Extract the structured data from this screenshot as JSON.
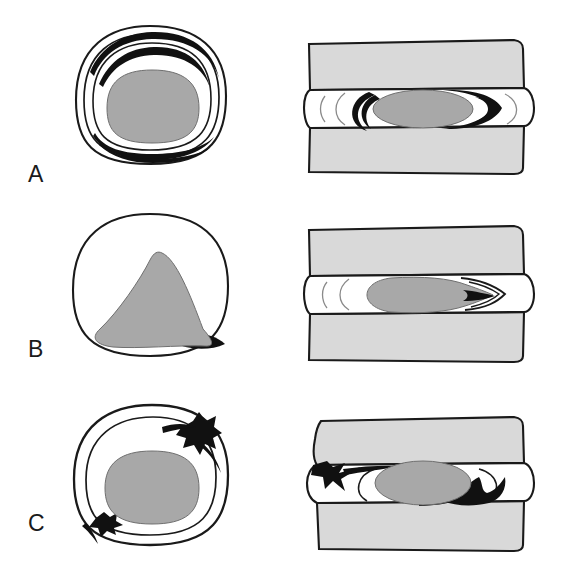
{
  "figure": {
    "width": 567,
    "height": 571,
    "background": "#ffffff",
    "panel_columns": [
      "axial cross-section view",
      "sagittal mid-line section view"
    ]
  },
  "colors": {
    "nucleus_gray": "#a8a8a8",
    "vertebra_gray": "#d9d9d9",
    "herniation_black": "#111111",
    "outline_black": "#1a1a1a",
    "background_white": "#ffffff"
  },
  "rows": [
    {
      "label": "A",
      "caption": "Disc bulge with intact concentric annular lamellae",
      "axial": {
        "name": "axial-view-a",
        "rings": 3,
        "nucleus_shape": "rounded-oval",
        "dark_segments": [
          "upper-left lamella",
          "upper-right lamella",
          "inferior lamella"
        ],
        "herniation": "none"
      },
      "sagittal": {
        "name": "sagittal-view-a",
        "vertebrae": 2,
        "nucleus_shape": "horizontal-oval",
        "dark_segments": [
          "anterior crescent",
          "posterior D-shaped protrusion"
        ],
        "herniation": "contained protrusion"
      }
    },
    {
      "label": "B",
      "caption": "Nucleus migration with focal annular extrusion",
      "axial": {
        "name": "axial-view-b",
        "rings": 1,
        "nucleus_shape": "triangular",
        "dark_segments": [
          "postero-lateral right wedge"
        ],
        "herniation": "focal extrusion"
      },
      "sagittal": {
        "name": "sagittal-view-b",
        "vertebrae": 2,
        "nucleus_shape": "tapering-teardrop",
        "dark_segments": [
          "posterior pointed tip"
        ],
        "herniation": "focal extrusion"
      }
    },
    {
      "label": "C",
      "caption": "Sequestered fragments through ruptured annulus",
      "axial": {
        "name": "axial-view-c",
        "rings": 2,
        "nucleus_shape": "rounded-oval",
        "dark_segments": [
          "upper-right ruptured fragment",
          "lower-left ruptured fragment"
        ],
        "herniation": "sequestration"
      },
      "sagittal": {
        "name": "sagittal-view-c",
        "vertebrae": 2,
        "nucleus_shape": "horizontal-oval",
        "dark_segments": [
          "anterior spiked fragment",
          "posterior spiked fragment"
        ],
        "herniation": "sequestration"
      }
    }
  ]
}
